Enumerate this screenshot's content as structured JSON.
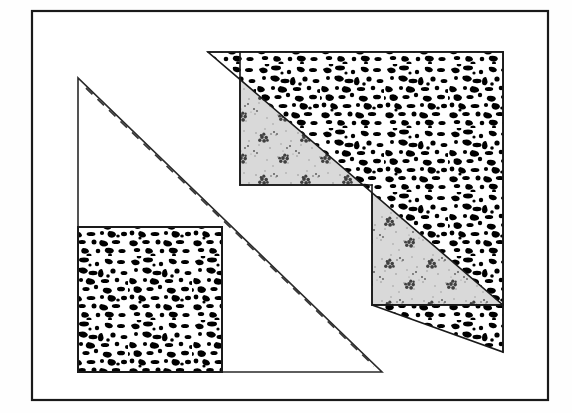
{
  "document": {
    "title": "Geometric Dissection Figure",
    "background_color": "#fefefe",
    "paper_color": "#ffffff",
    "ink_color": "#1a1a1a",
    "width": 572,
    "height": 413
  },
  "frame": {
    "name": "outer-border-rectangle",
    "x": 32,
    "y": 11,
    "width": 516,
    "height": 389,
    "stroke_color": "#1a1a1a",
    "stroke_width": 2.2,
    "fill": "#ffffff"
  },
  "textures": {
    "speckle": {
      "label": "dense-black-speckle",
      "description": "dense irregular black blobs on white",
      "base_color": "#ffffff",
      "mark_color": "#000000",
      "density": "high"
    },
    "stipple": {
      "label": "light-gray-stipple-with-rosettes",
      "description": "light gray stippled field with small dark rosette clusters in a grid",
      "base_color": "#d8d8d8",
      "mark_color": "#3a3a3a",
      "density": "medium"
    }
  },
  "shapes": [
    {
      "name": "outline-right-triangle",
      "kind": "polygon",
      "fill": "none",
      "stroke_color": "#2a2a2a",
      "stroke_width": 1.6,
      "points": "78,78 78,372 382,372",
      "note": "unfilled right triangle, vertical leg on left, horizontal leg on bottom"
    },
    {
      "name": "fold-dashed-line",
      "kind": "polyline",
      "stroke_color": "#3a3a3a",
      "stroke_width": 1.8,
      "dash": "9 7",
      "points": "86,88 374,366",
      "note": "dashed line parallel to and just inside the hypotenuse"
    },
    {
      "name": "speckled-square",
      "kind": "rect",
      "texture": "speckle",
      "stroke_color": "#1a1a1a",
      "stroke_width": 2.0,
      "x": 78,
      "y": 227,
      "width": 144,
      "height": 145
    },
    {
      "name": "stippled-notched-polygon",
      "kind": "polygon",
      "texture": "stipple",
      "stroke_color": "#1a1a1a",
      "stroke_width": 1.6,
      "points": "240,52 240,185 372,185 372,305 503,305 503,52",
      "note": "L-shaped / notched region under the speckled triangles"
    },
    {
      "name": "speckled-upper-triangle",
      "kind": "polygon",
      "texture": "speckle",
      "stroke_color": "#1a1a1a",
      "stroke_width": 1.6,
      "points": "208,52 503,52 503,305",
      "note": "large speckled right triangle, hypotenuse from top-left down to bottom-right"
    },
    {
      "name": "speckled-lower-triangle",
      "kind": "polygon",
      "texture": "speckle",
      "stroke_color": "#1a1a1a",
      "stroke_width": 1.6,
      "points": "372,305 503,305 503,352",
      "note": "small speckled right triangle hanging below the notch"
    }
  ],
  "edges": [
    {
      "name": "notch-horizontal-edge",
      "x1": 240,
      "y1": 185,
      "x2": 372,
      "y2": 185
    },
    {
      "name": "notch-vertical-edge",
      "x1": 372,
      "y1": 185,
      "x2": 372,
      "y2": 305
    },
    {
      "name": "notch-bottom-edge",
      "x1": 372,
      "y1": 305,
      "x2": 503,
      "y2": 305
    },
    {
      "name": "stipple-left-edge",
      "x1": 240,
      "y1": 52,
      "x2": 240,
      "y2": 185
    },
    {
      "name": "upper-top-edge",
      "x1": 208,
      "y1": 52,
      "x2": 503,
      "y2": 52
    },
    {
      "name": "upper-hypotenuse",
      "x1": 208,
      "y1": 52,
      "x2": 503,
      "y2": 305
    },
    {
      "name": "lower-hypotenuse",
      "x1": 372,
      "y1": 305,
      "x2": 503,
      "y2": 352
    },
    {
      "name": "right-edge",
      "x1": 503,
      "y1": 52,
      "x2": 503,
      "y2": 352
    }
  ]
}
